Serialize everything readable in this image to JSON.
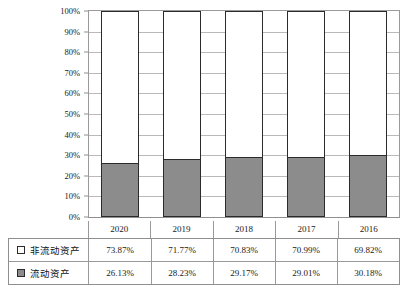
{
  "chart_data": {
    "type": "bar",
    "subtype": "stacked-100-percent",
    "title": "",
    "xlabel": "",
    "ylabel": "",
    "ylim": [
      0,
      100
    ],
    "ytick_labels": [
      "100%",
      "90%",
      "80%",
      "70%",
      "60%",
      "50%",
      "40%",
      "30%",
      "20%",
      "10%",
      "0%"
    ],
    "ytick_values": [
      100,
      90,
      80,
      70,
      60,
      50,
      40,
      30,
      20,
      10,
      0
    ],
    "grid": true,
    "legend_position": "bottom-table",
    "categories": [
      "2020",
      "2019",
      "2018",
      "2017",
      "2016"
    ],
    "series": [
      {
        "name": "非流动资产",
        "color": "#ffffff",
        "swatch": "sw-white",
        "values": [
          73.87,
          71.77,
          70.83,
          70.99,
          69.82
        ],
        "labels": [
          "73.87%",
          "71.77%",
          "70.83%",
          "70.99%",
          "69.82%"
        ]
      },
      {
        "name": "流动资产",
        "color": "#8c8c8c",
        "swatch": "sw-gray",
        "values": [
          26.13,
          28.23,
          29.17,
          29.01,
          30.18
        ],
        "labels": [
          "26.13%",
          "28.23%",
          "29.17%",
          "29.01%",
          "30.18%"
        ]
      }
    ]
  },
  "axis": {
    "ticks": [
      {
        "label": "100%",
        "value": 100
      },
      {
        "label": "90%",
        "value": 90
      },
      {
        "label": "80%",
        "value": 80
      },
      {
        "label": "70%",
        "value": 70
      },
      {
        "label": "60%",
        "value": 60
      },
      {
        "label": "50%",
        "value": 50
      },
      {
        "label": "40%",
        "value": 40
      },
      {
        "label": "30%",
        "value": 30
      },
      {
        "label": "20%",
        "value": 20
      },
      {
        "label": "10%",
        "value": 10
      },
      {
        "label": "0%",
        "value": 0
      }
    ]
  },
  "table": {
    "years": [
      "2020",
      "2019",
      "2018",
      "2017",
      "2016"
    ],
    "rows": [
      {
        "label": "非流动资产",
        "swatch": "sw-white",
        "cells": [
          "73.87%",
          "71.77%",
          "70.83%",
          "70.99%",
          "69.82%"
        ]
      },
      {
        "label": "流动资产",
        "swatch": "sw-gray",
        "cells": [
          "26.13%",
          "28.23%",
          "29.17%",
          "29.01%",
          "30.18%"
        ]
      }
    ]
  },
  "colors": {
    "current_assets": "#8c8c8c",
    "noncurrent_assets": "#ffffff",
    "border": "#2b2b2b",
    "gridline": "#b9b9b9",
    "frame": "#9a9a9a"
  }
}
